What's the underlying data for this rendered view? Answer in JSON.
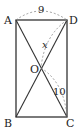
{
  "diagram": {
    "type": "rectangle-with-diagonals",
    "points": {
      "A": {
        "label": "A",
        "x": 16,
        "y": 20
      },
      "D": {
        "label": "D",
        "x": 67,
        "y": 20
      },
      "B": {
        "label": "B",
        "x": 16,
        "y": 117
      },
      "C": {
        "label": "C",
        "x": 67,
        "y": 117
      },
      "O": {
        "label": "O",
        "x": 41,
        "y": 68
      }
    },
    "measures": {
      "AD": "9",
      "DO": "x",
      "OC": "10"
    },
    "colors": {
      "stroke": "#333333",
      "dashed": "#888888",
      "background": "#ffffff"
    }
  }
}
